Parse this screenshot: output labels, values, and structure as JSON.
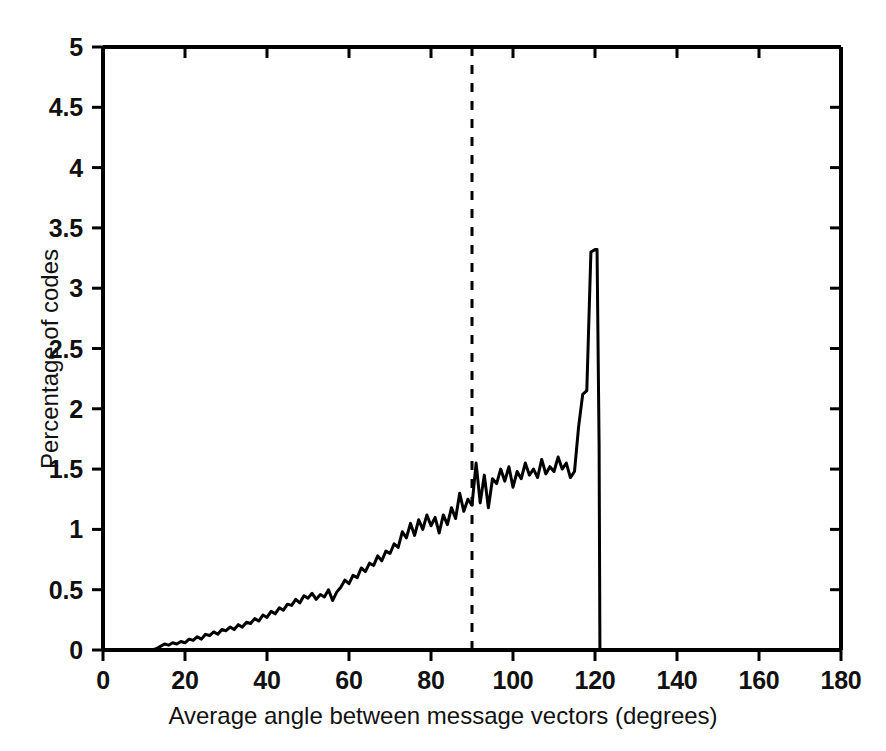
{
  "chart_data": {
    "type": "line",
    "title": "",
    "xlabel": "Average angle between message vectors (degrees)",
    "ylabel": "Percentage of codes",
    "xlim": [
      0,
      180
    ],
    "ylim": [
      0,
      5
    ],
    "xticks": [
      0,
      20,
      40,
      60,
      80,
      100,
      120,
      140,
      160,
      180
    ],
    "yticks": [
      0,
      0.5,
      1,
      1.5,
      2,
      2.5,
      3,
      3.5,
      4,
      4.5,
      5
    ],
    "xtick_labels": [
      "0",
      "20",
      "40",
      "60",
      "80",
      "100",
      "120",
      "140",
      "160",
      "180"
    ],
    "ytick_labels": [
      "0",
      "0.5",
      "1",
      "1.5",
      "2",
      "2.5",
      "3",
      "3.5",
      "4",
      "4.5",
      "5"
    ],
    "grid": false,
    "legend": null,
    "line_color": "#000000",
    "line_width": 3,
    "annotations": [
      {
        "name": "orthogonality-reference-line",
        "type": "vertical-dashed-line",
        "x": 90,
        "style": "dashed",
        "color": "#000000"
      }
    ],
    "series": [
      {
        "name": "Percentage of codes",
        "x": [
          0,
          2,
          4,
          6,
          8,
          10,
          12,
          13,
          14,
          15,
          16,
          17,
          18,
          19,
          20,
          21,
          22,
          23,
          24,
          25,
          26,
          27,
          28,
          29,
          30,
          31,
          32,
          33,
          34,
          35,
          36,
          37,
          38,
          39,
          40,
          41,
          42,
          43,
          44,
          45,
          46,
          47,
          48,
          49,
          50,
          51,
          52,
          53,
          54,
          55,
          56,
          57,
          58,
          59,
          60,
          61,
          62,
          63,
          64,
          65,
          66,
          67,
          68,
          69,
          70,
          71,
          72,
          73,
          74,
          75,
          76,
          77,
          78,
          79,
          80,
          81,
          82,
          83,
          84,
          85,
          86,
          87,
          88,
          89,
          90,
          91,
          92,
          93,
          94,
          95,
          96,
          97,
          98,
          99,
          100,
          101,
          102,
          103,
          104,
          105,
          106,
          107,
          108,
          109,
          110,
          111,
          112,
          113,
          114,
          115,
          116,
          117,
          118,
          119,
          120,
          120.5,
          121,
          121.2
        ],
        "y": [
          0,
          0,
          0,
          0,
          0,
          0,
          0,
          0.01,
          0.03,
          0.05,
          0.04,
          0.06,
          0.05,
          0.07,
          0.06,
          0.09,
          0.08,
          0.11,
          0.09,
          0.13,
          0.12,
          0.15,
          0.13,
          0.17,
          0.16,
          0.19,
          0.17,
          0.21,
          0.19,
          0.23,
          0.22,
          0.26,
          0.24,
          0.29,
          0.27,
          0.32,
          0.3,
          0.35,
          0.33,
          0.38,
          0.37,
          0.42,
          0.39,
          0.45,
          0.43,
          0.47,
          0.42,
          0.46,
          0.44,
          0.5,
          0.41,
          0.48,
          0.52,
          0.58,
          0.55,
          0.62,
          0.6,
          0.68,
          0.65,
          0.72,
          0.7,
          0.78,
          0.74,
          0.82,
          0.8,
          0.88,
          0.85,
          0.98,
          0.93,
          1.05,
          0.95,
          1.08,
          1.0,
          1.12,
          1.03,
          1.1,
          0.97,
          1.12,
          1.04,
          1.18,
          1.09,
          1.3,
          1.15,
          1.25,
          1.2,
          1.55,
          1.22,
          1.45,
          1.18,
          1.42,
          1.38,
          1.5,
          1.4,
          1.52,
          1.35,
          1.48,
          1.42,
          1.55,
          1.45,
          1.5,
          1.43,
          1.58,
          1.46,
          1.52,
          1.48,
          1.6,
          1.5,
          1.55,
          1.43,
          1.48,
          1.85,
          2.12,
          2.15,
          3.3,
          3.32,
          3.32,
          1.7,
          0
        ]
      }
    ]
  },
  "axes": {
    "x_title": "Average angle between message vectors (degrees)",
    "y_title": "Percentage of codes"
  }
}
